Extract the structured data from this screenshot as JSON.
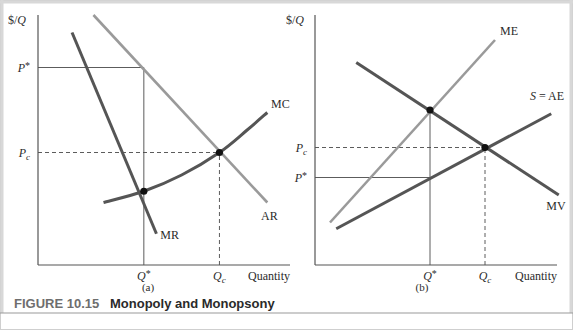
{
  "figure": {
    "caption_number": "FIGURE 10.15",
    "caption_title": "Monopoly and Monopsony",
    "colors": {
      "dark_curve": "#555555",
      "light_curve": "#9a9a9a",
      "axis": "#555555",
      "caption_number": "#6e6e6e",
      "caption_title": "#2a2a2a",
      "border": "#cfcfcf"
    }
  },
  "chart_data": [
    {
      "type": "line",
      "panel_label": "(a)",
      "title": "",
      "ylabel": "$/Q",
      "xlabel": "Quantity",
      "grid": false,
      "xlim": [
        0,
        10
      ],
      "ylim": [
        0,
        10
      ],
      "y_ticks": [
        {
          "label": "P*",
          "value": 7.9
        },
        {
          "label": "Pc",
          "value": 4.5
        }
      ],
      "x_ticks": [
        {
          "label": "Q*",
          "value": 4.2
        },
        {
          "label": "Qc",
          "value": 7.2
        }
      ],
      "series": [
        {
          "name": "AR",
          "style": "light",
          "points": [
            [
              2.2,
              10.0
            ],
            [
              9.1,
              2.5
            ]
          ]
        },
        {
          "name": "MR",
          "style": "dark",
          "points": [
            [
              1.35,
              9.3
            ],
            [
              4.7,
              1.25
            ]
          ]
        },
        {
          "name": "MC",
          "style": "dark",
          "curve": true,
          "points": [
            [
              2.6,
              2.5
            ],
            [
              4.2,
              2.95
            ],
            [
              5.7,
              3.6
            ],
            [
              7.2,
              4.5
            ],
            [
              8.3,
              5.4
            ],
            [
              9.1,
              6.1
            ]
          ]
        }
      ],
      "reference_lines": [
        {
          "name": "P*",
          "kind": "solid",
          "from": [
            0,
            7.9
          ],
          "to": [
            4.2,
            7.9
          ]
        },
        {
          "name": "Q*",
          "kind": "solid",
          "from": [
            4.2,
            0
          ],
          "to": [
            4.2,
            7.9
          ]
        },
        {
          "name": "Pc",
          "kind": "dashed",
          "from": [
            0,
            4.5
          ],
          "to": [
            7.2,
            4.5
          ]
        },
        {
          "name": "Qc",
          "kind": "dashed",
          "from": [
            7.2,
            0
          ],
          "to": [
            7.2,
            4.5
          ]
        }
      ],
      "points": [
        {
          "name": "MR = MC",
          "x": 4.2,
          "y": 2.95
        },
        {
          "name": "AR = MC",
          "x": 7.2,
          "y": 4.5
        }
      ],
      "annotations": [
        {
          "text": "MC",
          "x": 9.25,
          "y": 6.3
        },
        {
          "text": "AR",
          "x": 8.85,
          "y": 1.8
        },
        {
          "text": "MR",
          "x": 4.85,
          "y": 1.05
        }
      ]
    },
    {
      "type": "line",
      "panel_label": "(b)",
      "title": "",
      "ylabel": "$/Q",
      "xlabel": "Quantity",
      "grid": false,
      "xlim": [
        0,
        10
      ],
      "ylim": [
        0,
        10
      ],
      "y_ticks": [
        {
          "label": "Pc",
          "value": 4.7
        },
        {
          "label": "P*",
          "value": 3.5
        }
      ],
      "x_ticks": [
        {
          "label": "Q*",
          "value": 4.6
        },
        {
          "label": "Qc",
          "value": 6.8
        }
      ],
      "series": [
        {
          "name": "ME",
          "style": "light",
          "points": [
            [
              0.6,
              1.7
            ],
            [
              7.2,
              9.0
            ]
          ]
        },
        {
          "name": "MV",
          "style": "dark",
          "points": [
            [
              1.65,
              8.1
            ],
            [
              9.75,
              2.8
            ]
          ]
        },
        {
          "name": "S = AE",
          "style": "dark",
          "points": [
            [
              0.85,
              1.45
            ],
            [
              9.45,
              6.05
            ]
          ]
        }
      ],
      "reference_lines": [
        {
          "name": "Pc",
          "kind": "dashed",
          "from": [
            0,
            4.7
          ],
          "to": [
            6.8,
            4.7
          ]
        },
        {
          "name": "Qc",
          "kind": "dashed",
          "from": [
            6.8,
            0
          ],
          "to": [
            6.8,
            4.7
          ]
        },
        {
          "name": "P*",
          "kind": "solid",
          "from": [
            0,
            3.5
          ],
          "to": [
            4.6,
            3.5
          ]
        },
        {
          "name": "Q*",
          "kind": "solid",
          "from": [
            4.6,
            0
          ],
          "to": [
            4.6,
            6.2
          ]
        }
      ],
      "points": [
        {
          "name": "ME = MV",
          "x": 4.6,
          "y": 6.2
        },
        {
          "name": "AE = MV",
          "x": 6.8,
          "y": 4.7
        }
      ],
      "annotations": [
        {
          "text": "ME",
          "x": 7.4,
          "y": 9.2
        },
        {
          "text": "S = AE",
          "x": 8.6,
          "y": 6.6
        },
        {
          "text": "MV",
          "x": 9.25,
          "y": 2.2
        }
      ]
    }
  ]
}
